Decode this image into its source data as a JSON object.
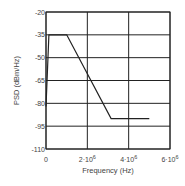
{
  "chart_data": {
    "type": "line",
    "title": "",
    "xlabel": "Frequency (Hz)",
    "ylabel": "PSD (dBm/Hz)",
    "xlim": [
      0,
      6000000
    ],
    "ylim": [
      -110,
      -20
    ],
    "x_ticks": [
      0,
      2000000,
      4000000,
      6000000
    ],
    "x_tick_labels": [
      {
        "base": "0",
        "exp": ""
      },
      {
        "base": "2·10",
        "exp": "6"
      },
      {
        "base": "4·10",
        "exp": "6"
      },
      {
        "base": "6·10",
        "exp": "6"
      }
    ],
    "y_ticks": [
      -20,
      -35,
      -50,
      -65,
      -80,
      -95,
      -110
    ],
    "y_tick_labels": [
      "-20",
      "-35",
      "-50",
      "-65",
      "-80",
      "-95",
      "-110"
    ],
    "grid": true,
    "legend": null,
    "series": [
      {
        "name": "PSD mask",
        "x": [
          0,
          138000,
          1000000,
          3150000,
          5000000
        ],
        "y": [
          -82,
          -35,
          -35,
          -90,
          -90
        ]
      }
    ]
  }
}
